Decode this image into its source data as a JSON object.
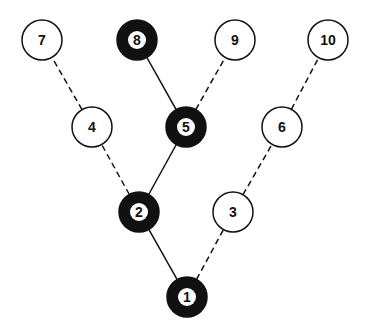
{
  "diagram": {
    "type": "tree",
    "nodes": [
      {
        "id": "1",
        "label": "1",
        "x": 187,
        "y": 297,
        "filled": true
      },
      {
        "id": "2",
        "label": "2",
        "x": 139,
        "y": 212,
        "filled": true
      },
      {
        "id": "3",
        "label": "3",
        "x": 233,
        "y": 212,
        "filled": false
      },
      {
        "id": "4",
        "label": "4",
        "x": 92,
        "y": 127,
        "filled": false
      },
      {
        "id": "5",
        "label": "5",
        "x": 186,
        "y": 127,
        "filled": true
      },
      {
        "id": "6",
        "label": "6",
        "x": 282,
        "y": 127,
        "filled": false
      },
      {
        "id": "7",
        "label": "7",
        "x": 42,
        "y": 40,
        "filled": false
      },
      {
        "id": "8",
        "label": "8",
        "x": 137,
        "y": 40,
        "filled": true
      },
      {
        "id": "9",
        "label": "9",
        "x": 235,
        "y": 40,
        "filled": false
      },
      {
        "id": "10",
        "label": "10",
        "x": 328,
        "y": 40,
        "filled": false
      }
    ],
    "edges": [
      {
        "from": "1",
        "to": "2",
        "style": "solid"
      },
      {
        "from": "1",
        "to": "3",
        "style": "dashed"
      },
      {
        "from": "2",
        "to": "4",
        "style": "dashed"
      },
      {
        "from": "2",
        "to": "5",
        "style": "solid"
      },
      {
        "from": "3",
        "to": "6",
        "style": "dashed"
      },
      {
        "from": "4",
        "to": "7",
        "style": "dashed"
      },
      {
        "from": "5",
        "to": "8",
        "style": "solid"
      },
      {
        "from": "5",
        "to": "9",
        "style": "dashed"
      },
      {
        "from": "6",
        "to": "10",
        "style": "dashed"
      }
    ],
    "colors": {
      "stroke": "#111111",
      "fill_dark": "#111111",
      "fill_light": "#ffffff"
    }
  }
}
